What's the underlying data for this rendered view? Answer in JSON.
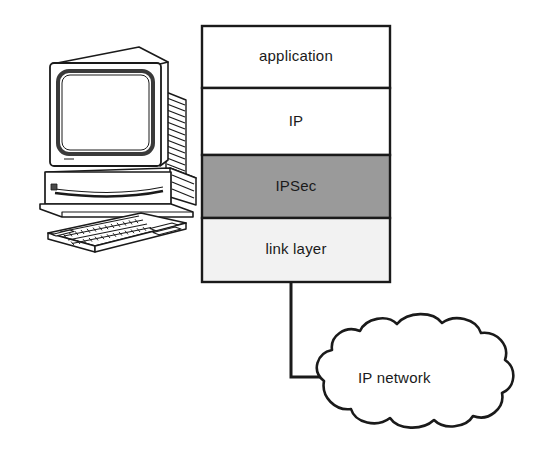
{
  "diagram": {
    "background_color": "#ffffff",
    "line_color": "#1a1a1a",
    "text_color": "#1a1a1a"
  },
  "host": {
    "icon_name": "desktop-workstation-icon",
    "description": "CRT monitor on desktop computer case with keyboard"
  },
  "stack": {
    "name": "protocol-stack",
    "x": 202,
    "y": 26,
    "width": 188,
    "height": 256,
    "layers": [
      {
        "label": "application",
        "fill": "#ffffff",
        "y": 26,
        "height": 62
      },
      {
        "label": "IP",
        "fill": "#ffffff",
        "y": 88,
        "height": 67
      },
      {
        "label": "IPSec",
        "fill": "#9a9a9a",
        "y": 155,
        "height": 63
      },
      {
        "label": "link layer",
        "fill": "#f2f2f2",
        "y": 218,
        "height": 64
      }
    ]
  },
  "network": {
    "cloud_name": "ip-network-cloud",
    "label": "IP network",
    "label_x": 358,
    "label_y": 369
  },
  "connector": {
    "name": "link-layer-to-network-connector",
    "from_x": 291,
    "from_y": 282,
    "corner_y": 377,
    "to_x": 324
  }
}
